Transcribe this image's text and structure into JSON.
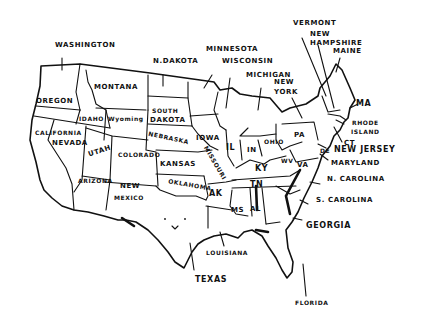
{
  "map": {
    "title": "United States (hand-drawn)",
    "ink_color": "#111111",
    "paper_color": "#ffffff",
    "labels": {
      "washington": "WASHINGTON",
      "oregon": "OREGON",
      "california": "CALIFORNIA",
      "nevada": "NEVADA",
      "idaho": "IDAHO",
      "montana": "MONTANA",
      "wyoming": "Wyoming",
      "utah": "UTAH",
      "arizona": "ARIZONA",
      "colorado": "COLORADO",
      "new_mexico_1": "NEW",
      "new_mexico_2": "MEXICO",
      "north_dakota": "N.DAKOTA",
      "south_dakota_1": "SOUTH",
      "south_dakota_2": "DAKOTA",
      "nebraska": "NEBRASKA",
      "kansas": "KANSAS",
      "oklahoma": "OKLAHOMA",
      "texas": "TEXAS",
      "minnesota": "MINNESOTA",
      "iowa": "IOWA",
      "missouri": "MISSOURI",
      "arkansas": "AK",
      "louisiana": "LOUISIANA",
      "wisconsin": "WISCONSIN",
      "illinois": "IL",
      "michigan": "MICHIGAN",
      "indiana": "IN",
      "ohio": "OHIO",
      "kentucky": "KY",
      "tennessee": "TN",
      "mississippi": "MS",
      "alabama": "AL",
      "georgia": "GEORGIA",
      "florida": "FLORIDA",
      "south_carolina": "S. CAROLINA",
      "north_carolina": "N. CAROLINA",
      "virginia": "VA",
      "west_virginia": "WV",
      "maryland": "MARYLAND",
      "delaware": "DE",
      "new_jersey": "NEW JERSEY",
      "pennsylvania": "PA",
      "new_york_1": "NEW",
      "new_york_2": "YORK",
      "connecticut": "CT",
      "rhode_island_1": "RHODE",
      "rhode_island_2": "ISLAND",
      "massachusetts": "MA",
      "vermont": "VERMONT",
      "new_hampshire_1": "NEW",
      "new_hampshire_2": "HAMPSHIRE",
      "maine": "MAINE"
    }
  }
}
